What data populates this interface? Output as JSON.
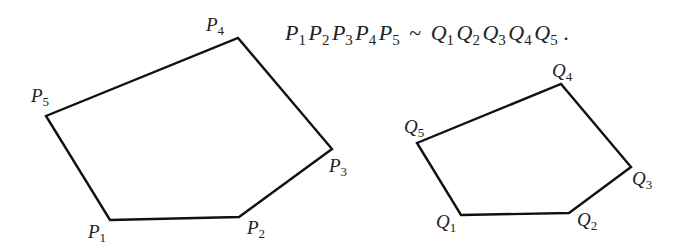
{
  "equation": {
    "left": [
      {
        "letter": "P",
        "sub": "1"
      },
      {
        "letter": "P",
        "sub": "2"
      },
      {
        "letter": "P",
        "sub": "3"
      },
      {
        "letter": "P",
        "sub": "4"
      },
      {
        "letter": "P",
        "sub": "5"
      }
    ],
    "relation": "~",
    "right": [
      {
        "letter": "Q",
        "sub": "1"
      },
      {
        "letter": "Q",
        "sub": "2"
      },
      {
        "letter": "Q",
        "sub": "3"
      },
      {
        "letter": "Q",
        "sub": "4"
      },
      {
        "letter": "Q",
        "sub": "5"
      }
    ],
    "terminator": "."
  },
  "pentagon_p": {
    "vertices": [
      {
        "name": "P",
        "sub": "1",
        "x": 110,
        "y": 220
      },
      {
        "name": "P",
        "sub": "2",
        "x": 239,
        "y": 217
      },
      {
        "name": "P",
        "sub": "3",
        "x": 332,
        "y": 149
      },
      {
        "name": "P",
        "sub": "4",
        "x": 238,
        "y": 38
      },
      {
        "name": "P",
        "sub": "5",
        "x": 46,
        "y": 116
      }
    ]
  },
  "pentagon_q": {
    "vertices": [
      {
        "name": "Q",
        "sub": "1",
        "x": 461,
        "y": 215
      },
      {
        "name": "Q",
        "sub": "2",
        "x": 569,
        "y": 213
      },
      {
        "name": "Q",
        "sub": "3",
        "x": 631,
        "y": 167
      },
      {
        "name": "Q",
        "sub": "4",
        "x": 561,
        "y": 84
      },
      {
        "name": "Q",
        "sub": "5",
        "x": 417,
        "y": 143
      }
    ]
  }
}
